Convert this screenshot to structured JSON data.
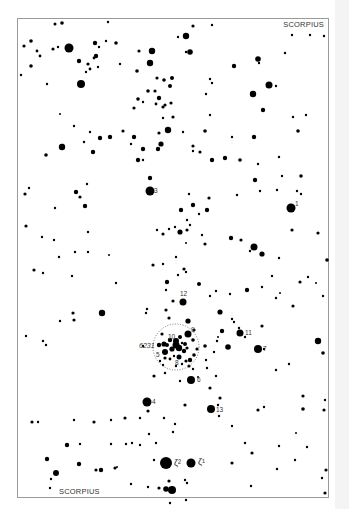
{
  "map": {
    "title_top": "SCORPIUS",
    "title_bottom": "SCORPIUS",
    "cluster_label": "6231",
    "frame": {
      "x": 17,
      "y": 18,
      "w": 311,
      "h": 479
    },
    "cluster_circle": {
      "cx": 176,
      "cy": 347,
      "r": 23
    },
    "colors": {
      "ink": "#000000",
      "frame": "#9a9a9a",
      "label": "#333333"
    },
    "labeled_stars": [
      {
        "label": "1",
        "x": 291,
        "y": 208,
        "r": 4.5
      },
      {
        "label": "3",
        "x": 150,
        "y": 191,
        "r": 4.5
      },
      {
        "label": "4",
        "x": 147,
        "y": 402,
        "r": 4.5
      },
      {
        "label": "5",
        "x": 165,
        "y": 352,
        "r": 3
      },
      {
        "label": "6",
        "x": 191,
        "y": 380,
        "r": 4
      },
      {
        "label": "7",
        "x": 258,
        "y": 349,
        "r": 4
      },
      {
        "label": "8",
        "x": 179,
        "y": 357,
        "r": 2.5
      },
      {
        "label": "9",
        "x": 188,
        "y": 334,
        "r": 3.5
      },
      {
        "label": "10",
        "x": 176,
        "y": 341,
        "r": 3
      },
      {
        "label": "11",
        "x": 240,
        "y": 333,
        "r": 3.5
      },
      {
        "label": "12",
        "x": 183,
        "y": 302,
        "r": 3.5
      },
      {
        "label": "13",
        "x": 211,
        "y": 409,
        "r": 4
      },
      {
        "label": "ζ²",
        "x": 166,
        "y": 463,
        "r": 6
      },
      {
        "label": "ζ¹",
        "x": 191,
        "y": 463,
        "r": 4.5
      }
    ],
    "stars": [
      [
        55,
        24,
        1.5
      ],
      [
        62,
        23,
        1.8
      ],
      [
        31,
        41,
        1.8
      ],
      [
        24,
        46,
        1.6
      ],
      [
        37,
        51,
        1.4
      ],
      [
        40,
        56,
        1.4
      ],
      [
        53,
        49,
        1.6
      ],
      [
        69,
        48,
        4.5
      ],
      [
        58,
        47,
        1.2
      ],
      [
        108,
        22,
        1.2
      ],
      [
        79,
        61,
        2.2
      ],
      [
        96,
        56,
        2.2
      ],
      [
        95,
        43,
        2.2
      ],
      [
        88,
        64,
        1.6
      ],
      [
        94,
        58,
        1.4
      ],
      [
        90,
        69,
        1.4
      ],
      [
        86,
        72,
        1.2
      ],
      [
        116,
        43,
        1.8
      ],
      [
        106,
        41,
        1.2
      ],
      [
        99,
        47,
        1.2
      ],
      [
        81,
        84,
        4
      ],
      [
        98,
        67,
        1.2
      ],
      [
        31,
        66,
        1.8
      ],
      [
        47,
        84,
        1.2
      ],
      [
        21,
        75,
        1.2
      ],
      [
        60,
        114,
        1
      ],
      [
        120,
        64,
        1.2
      ],
      [
        139,
        51,
        1.6
      ],
      [
        152,
        51,
        3.2
      ],
      [
        150,
        63,
        3.2
      ],
      [
        137,
        71,
        1.8
      ],
      [
        157,
        78,
        1.6
      ],
      [
        164,
        80,
        1.8
      ],
      [
        172,
        78,
        2
      ],
      [
        170,
        86,
        2
      ],
      [
        155,
        91,
        1.6
      ],
      [
        148,
        91,
        1.8
      ],
      [
        138,
        99,
        1.8
      ],
      [
        156,
        104,
        1.4
      ],
      [
        159,
        98,
        2.2
      ],
      [
        165,
        105,
        1.6
      ],
      [
        171,
        103,
        1.6
      ],
      [
        163,
        107,
        1.6
      ],
      [
        134,
        108,
        1.6
      ],
      [
        143,
        102,
        1.2
      ],
      [
        163,
        118,
        1.2
      ],
      [
        173,
        117,
        1.6
      ],
      [
        186,
        36,
        3.2
      ],
      [
        178,
        37,
        1.2
      ],
      [
        190,
        52,
        2.8
      ],
      [
        186,
        52,
        1.2
      ],
      [
        193,
        26,
        1.6
      ],
      [
        212,
        25,
        1.2
      ],
      [
        234,
        66,
        2.2
      ],
      [
        258,
        59,
        2.8
      ],
      [
        259,
        63,
        1.2
      ],
      [
        269,
        85,
        3.5
      ],
      [
        253,
        94,
        3.2
      ],
      [
        263,
        110,
        2.2
      ],
      [
        210,
        79,
        1.2
      ],
      [
        212,
        83,
        1.2
      ],
      [
        206,
        94,
        1.2
      ],
      [
        210,
        115,
        1.2
      ],
      [
        205,
        131,
        1.8
      ],
      [
        232,
        137,
        1.2
      ],
      [
        254,
        137,
        2.2
      ],
      [
        276,
        86,
        1.2
      ],
      [
        285,
        53,
        1.2
      ],
      [
        292,
        35,
        1.2
      ],
      [
        310,
        35,
        1.2
      ],
      [
        324,
        36,
        1.2
      ],
      [
        293,
        117,
        1.2
      ],
      [
        298,
        131,
        1.8
      ],
      [
        306,
        115,
        1.2
      ],
      [
        62,
        147,
        3.2
      ],
      [
        46,
        155,
        1.8
      ],
      [
        74,
        126,
        1.2
      ],
      [
        63,
        145,
        1.2
      ],
      [
        90,
        132,
        1.2
      ],
      [
        100,
        138,
        2.2
      ],
      [
        93,
        152,
        2.2
      ],
      [
        84,
        142,
        1.2
      ],
      [
        110,
        137,
        2.2
      ],
      [
        123,
        131,
        1.6
      ],
      [
        134,
        137,
        2.2
      ],
      [
        131,
        144,
        1.2
      ],
      [
        143,
        149,
        2.2
      ],
      [
        138,
        160,
        2.2
      ],
      [
        143,
        160,
        1.2
      ],
      [
        159,
        133,
        1.6
      ],
      [
        161,
        144,
        2.6
      ],
      [
        158,
        149,
        2.2
      ],
      [
        150,
        178,
        2.2
      ],
      [
        76,
        192,
        2.2
      ],
      [
        80,
        197,
        1.6
      ],
      [
        85,
        206,
        2.2
      ],
      [
        29,
        188,
        1.2
      ],
      [
        25,
        194,
        1.6
      ],
      [
        87,
        184,
        1.2
      ],
      [
        55,
        208,
        1.2
      ],
      [
        26,
        226,
        1.6
      ],
      [
        88,
        232,
        1.2
      ],
      [
        168,
        130,
        3.2
      ],
      [
        183,
        132,
        1.2
      ],
      [
        193,
        146,
        1.6
      ],
      [
        193,
        151,
        1.2
      ],
      [
        200,
        152,
        1.6
      ],
      [
        212,
        160,
        2.2
      ],
      [
        225,
        158,
        2.2
      ],
      [
        240,
        160,
        1.8
      ],
      [
        258,
        164,
        1.2
      ],
      [
        279,
        157,
        1.2
      ],
      [
        282,
        176,
        1.2
      ],
      [
        301,
        176,
        1.8
      ],
      [
        237,
        195,
        1.2
      ],
      [
        260,
        191,
        1.2
      ],
      [
        301,
        194,
        1.2
      ],
      [
        297,
        191,
        1.2
      ],
      [
        277,
        190,
        1.2
      ],
      [
        189,
        194,
        1.2
      ],
      [
        209,
        198,
        1.6
      ],
      [
        181,
        210,
        2.2
      ],
      [
        190,
        225,
        1.2
      ],
      [
        187,
        230,
        1.6
      ],
      [
        199,
        214,
        1.2
      ],
      [
        207,
        210,
        2.2
      ],
      [
        193,
        205,
        2.2
      ],
      [
        255,
        180,
        2.2
      ],
      [
        187,
        220,
        1.2
      ],
      [
        169,
        229,
        1.2
      ],
      [
        180,
        232,
        2.6
      ],
      [
        175,
        227,
        1.2
      ],
      [
        157,
        230,
        1.2
      ],
      [
        186,
        243,
        1
      ],
      [
        163,
        234,
        1.6
      ],
      [
        202,
        235,
        1.2
      ],
      [
        205,
        244,
        1.6
      ],
      [
        231,
        238,
        2.2
      ],
      [
        241,
        240,
        1.6
      ],
      [
        250,
        251,
        1.2
      ],
      [
        279,
        258,
        1.2
      ],
      [
        292,
        230,
        1.6
      ],
      [
        318,
        233,
        1.6
      ],
      [
        327,
        260,
        1.8
      ],
      [
        262,
        287,
        1.2
      ],
      [
        272,
        276,
        1.2
      ],
      [
        300,
        282,
        1.6
      ],
      [
        308,
        277,
        1.2
      ],
      [
        316,
        283,
        1
      ],
      [
        276,
        298,
        1.2
      ],
      [
        293,
        306,
        1.6
      ],
      [
        323,
        296,
        1.2
      ],
      [
        42,
        237,
        1.2
      ],
      [
        54,
        240,
        1.2
      ],
      [
        75,
        252,
        1.2
      ],
      [
        59,
        257,
        1.2
      ],
      [
        34,
        270,
        1.6
      ],
      [
        43,
        273,
        1.2
      ],
      [
        88,
        252,
        1.2
      ],
      [
        109,
        255,
        1
      ],
      [
        116,
        283,
        1.2
      ],
      [
        153,
        265,
        1.6
      ],
      [
        163,
        264,
        1.2
      ],
      [
        176,
        257,
        1.2
      ],
      [
        184,
        269,
        1.6
      ],
      [
        186,
        272,
        1.2
      ],
      [
        166,
        290,
        1.2
      ],
      [
        178,
        275,
        1.2
      ],
      [
        146,
        313,
        1.2
      ],
      [
        147,
        309,
        1.2
      ],
      [
        166,
        310,
        1.6
      ],
      [
        173,
        301,
        1.6
      ],
      [
        169,
        318,
        1.6
      ],
      [
        199,
        284,
        2
      ],
      [
        210,
        296,
        1.2
      ],
      [
        216,
        291,
        1.2
      ],
      [
        230,
        294,
        1.2
      ],
      [
        247,
        290,
        2.2
      ],
      [
        254,
        247,
        3.5
      ],
      [
        262,
        254,
        2.6
      ],
      [
        280,
        293,
        1
      ],
      [
        73,
        313,
        1.6
      ],
      [
        74,
        320,
        1.6
      ],
      [
        60,
        321,
        1.2
      ],
      [
        26,
        336,
        1.2
      ],
      [
        43,
        341,
        1.2
      ],
      [
        102,
        313,
        3.2
      ],
      [
        72,
        276,
        1.2
      ],
      [
        46,
        345,
        1.2
      ],
      [
        167,
        282,
        2.2
      ],
      [
        188,
        321,
        2.6
      ],
      [
        220,
        312,
        2.6
      ],
      [
        222,
        331,
        2.2
      ],
      [
        232,
        319,
        1.2
      ],
      [
        234,
        322,
        1.2
      ],
      [
        239,
        328,
        1.2
      ],
      [
        245,
        337,
        1.2
      ],
      [
        262,
        326,
        1.6
      ],
      [
        228,
        347,
        2.8
      ],
      [
        264,
        349,
        1.2
      ],
      [
        318,
        341,
        3.2
      ],
      [
        323,
        353,
        1.8
      ],
      [
        205,
        346,
        1.8
      ],
      [
        217,
        341,
        1.2
      ],
      [
        218,
        337,
        1
      ],
      [
        214,
        352,
        1.2
      ],
      [
        206,
        360,
        1.2
      ],
      [
        207,
        368,
        1.2
      ],
      [
        216,
        376,
        1.2
      ],
      [
        198,
        377,
        1
      ],
      [
        189,
        366,
        1.6
      ],
      [
        180,
        381,
        1.2
      ],
      [
        165,
        373,
        1.2
      ],
      [
        154,
        376,
        1.6
      ],
      [
        185,
        405,
        1.6
      ],
      [
        210,
        388,
        1.6
      ],
      [
        220,
        398,
        1.6
      ],
      [
        218,
        405,
        1.2
      ],
      [
        232,
        426,
        1.2
      ],
      [
        219,
        416,
        1.2
      ],
      [
        289,
        364,
        1.2
      ],
      [
        276,
        370,
        1.2
      ],
      [
        303,
        396,
        1.6
      ],
      [
        303,
        409,
        1.8
      ],
      [
        296,
        433,
        1
      ],
      [
        325,
        400,
        1.2
      ],
      [
        324,
        410,
        1.6
      ],
      [
        307,
        447,
        1.2
      ],
      [
        326,
        470,
        1.6
      ],
      [
        322,
        478,
        1.2
      ],
      [
        295,
        460,
        1.2
      ],
      [
        232,
        463,
        1.6
      ],
      [
        252,
        453,
        1.6
      ],
      [
        245,
        443,
        1.2
      ],
      [
        279,
        446,
        1.2
      ],
      [
        277,
        469,
        1.2
      ],
      [
        251,
        486,
        1.2
      ],
      [
        325,
        493,
        1.6
      ],
      [
        258,
        410,
        1.6
      ],
      [
        264,
        407,
        1.2
      ],
      [
        182,
        343,
        1.2
      ],
      [
        172,
        349,
        2.6
      ],
      [
        179,
        348,
        3.2
      ],
      [
        167,
        345,
        2
      ],
      [
        185,
        344,
        2
      ],
      [
        187,
        348,
        1.6
      ],
      [
        184,
        351,
        2.2
      ],
      [
        176,
        345,
        3.5
      ],
      [
        170,
        340,
        2.2
      ],
      [
        180,
        337,
        2
      ],
      [
        162,
        334,
        1.6
      ],
      [
        159,
        345,
        2.2
      ],
      [
        164,
        344,
        2.6
      ],
      [
        190,
        360,
        2.2
      ],
      [
        194,
        355,
        1.8
      ],
      [
        186,
        361,
        1.6
      ],
      [
        197,
        349,
        1.6
      ],
      [
        193,
        340,
        1.8
      ],
      [
        174,
        356,
        1.2
      ],
      [
        170,
        359,
        1.4
      ],
      [
        165,
        358,
        1.6
      ],
      [
        163,
        365,
        1.2
      ],
      [
        176,
        366,
        1.2
      ],
      [
        182,
        364,
        1.2
      ],
      [
        193,
        369,
        1.2
      ],
      [
        160,
        361,
        1.2
      ],
      [
        194,
        330,
        1.6
      ],
      [
        143,
        346,
        1.2
      ],
      [
        32,
        422,
        1.6
      ],
      [
        38,
        422,
        1.2
      ],
      [
        74,
        420,
        1.2
      ],
      [
        94,
        422,
        1.6
      ],
      [
        111,
        420,
        1.2
      ],
      [
        125,
        418,
        1.6
      ],
      [
        140,
        418,
        1.2
      ],
      [
        164,
        418,
        1.2
      ],
      [
        173,
        432,
        1.2
      ],
      [
        149,
        434,
        1.2
      ],
      [
        148,
        411,
        1.6
      ],
      [
        175,
        424,
        1.2
      ],
      [
        67,
        445,
        2.2
      ],
      [
        80,
        444,
        1.2
      ],
      [
        111,
        444,
        1.2
      ],
      [
        126,
        444,
        1.2
      ],
      [
        132,
        443,
        1.2
      ],
      [
        140,
        445,
        1.2
      ],
      [
        156,
        443,
        1.2
      ],
      [
        47,
        459,
        2.2
      ],
      [
        79,
        464,
        2.2
      ],
      [
        96,
        470,
        1.6
      ],
      [
        101,
        470,
        2.2
      ],
      [
        115,
        468,
        1.6
      ],
      [
        117,
        467,
        1
      ],
      [
        56,
        473,
        3
      ],
      [
        51,
        479,
        1.2
      ],
      [
        50,
        488,
        1.2
      ],
      [
        154,
        460,
        1.2
      ],
      [
        187,
        483,
        1.2
      ],
      [
        185,
        480,
        1.2
      ],
      [
        159,
        488,
        1.6
      ],
      [
        169,
        481,
        1.6
      ],
      [
        166,
        489,
        2.8
      ],
      [
        172,
        490,
        4
      ],
      [
        148,
        487,
        1.2
      ],
      [
        131,
        484,
        1.2
      ],
      [
        170,
        503,
        1.2
      ],
      [
        186,
        500,
        1.2
      ]
    ]
  }
}
